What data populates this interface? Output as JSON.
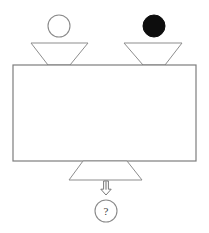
{
  "diagram": {
    "inputs": [
      {
        "id": "input-left",
        "particle_label": "open circle",
        "particle_fill": "#ffffff",
        "particle_stroke": "#8a8a8a",
        "particle_cx": 59,
        "particle_cy": 26,
        "particle_r": 11,
        "funnel_top_left_x": 31,
        "funnel_top_right_x": 88,
        "funnel_top_y": 43,
        "funnel_bottom_left_x": 48,
        "funnel_bottom_right_x": 70,
        "funnel_bottom_y": 65
      },
      {
        "id": "input-right",
        "particle_label": "filled circle",
        "particle_fill": "#0d0d0d",
        "particle_stroke": "#0d0d0d",
        "particle_cx": 154,
        "particle_cy": 26,
        "particle_r": 11,
        "funnel_top_left_x": 124,
        "funnel_top_right_x": 182,
        "funnel_top_y": 43,
        "funnel_bottom_left_x": 143,
        "funnel_bottom_right_x": 165,
        "funnel_bottom_y": 65
      }
    ],
    "vessel": {
      "id": "mixing-vessel",
      "label": "",
      "x": 13,
      "y": 65,
      "width": 183,
      "height": 96,
      "fill": "#ffffff",
      "stroke": "#7d7d7d"
    },
    "output": {
      "id": "output-funnel",
      "funnel_top_left_x": 83,
      "funnel_top_right_x": 127,
      "funnel_top_y": 161,
      "funnel_bottom_left_x": 69,
      "funnel_bottom_right_x": 142,
      "funnel_bottom_y": 180
    },
    "arrow": {
      "id": "output-arrow",
      "direction": "down",
      "x": 106,
      "y_top": 181,
      "y_bottom": 195
    },
    "result": {
      "id": "unknown-result",
      "label": "?",
      "cx": 106,
      "cy": 211,
      "r": 11,
      "stroke": "#8a8a8a",
      "fill": "#ffffff"
    }
  },
  "colors": {
    "background": "#ffffff",
    "line": "#8a8a8a",
    "line_dark": "#6f6f6f",
    "particle_filled": "#0d0d0d",
    "particle_open": "#ffffff",
    "text": "#3d3d3d"
  }
}
